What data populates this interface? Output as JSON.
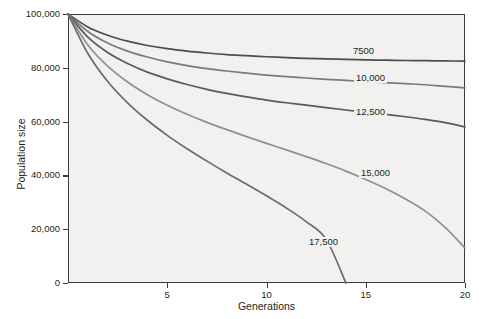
{
  "chart_data": {
    "type": "line",
    "title": "",
    "subtitle": "",
    "xlabel": "Generations",
    "ylabel": "Population size",
    "xlim": [
      0,
      20
    ],
    "ylim": [
      0,
      100000
    ],
    "xticks": [
      0,
      5,
      10,
      15,
      20
    ],
    "xtick_labels": [
      "",
      "5",
      "10",
      "15",
      "20"
    ],
    "yticks": [
      0,
      20000,
      40000,
      60000,
      80000,
      100000
    ],
    "ytick_labels": [
      "0",
      "20,000",
      "40,000",
      "60,000",
      "80,000",
      "100,000"
    ],
    "grid": false,
    "legend_position": "inline-annotations",
    "x": [
      0,
      1,
      2,
      3,
      4,
      5,
      6,
      7,
      8,
      9,
      10,
      11,
      12,
      13,
      14,
      15,
      16,
      17,
      18,
      19,
      20
    ],
    "series": [
      {
        "name": "7500",
        "label": "7500",
        "color": "#4d4d4d",
        "values": [
          100000,
          95200,
          92100,
          89900,
          88300,
          87100,
          86200,
          85500,
          84900,
          84500,
          84100,
          83800,
          83500,
          83300,
          83100,
          82950,
          82820,
          82720,
          82640,
          82560,
          82500
        ]
      },
      {
        "name": "10,000",
        "label": "10,000",
        "color": "#7a7a7a",
        "values": [
          100000,
          93500,
          89200,
          86200,
          84000,
          82200,
          80800,
          79700,
          78800,
          78000,
          77300,
          76700,
          76200,
          75700,
          75300,
          74900,
          74500,
          74100,
          73700,
          73100,
          72500
        ]
      },
      {
        "name": "12,500",
        "label": "12,500",
        "color": "#5a5a5a",
        "values": [
          100000,
          91400,
          85700,
          81600,
          78400,
          75900,
          73800,
          72000,
          70500,
          69200,
          68000,
          67000,
          66100,
          65200,
          64300,
          63500,
          62700,
          61800,
          60800,
          59600,
          58000
        ]
      },
      {
        "name": "15,000",
        "label": "15,000",
        "color": "#909090",
        "values": [
          100000,
          88500,
          80600,
          74700,
          70000,
          66100,
          62700,
          59700,
          57000,
          54400,
          51900,
          49500,
          47000,
          44400,
          41600,
          38500,
          35100,
          31200,
          26700,
          20700,
          13000
        ]
      },
      {
        "name": "17,500",
        "label": "17,500",
        "color": "#6b6b6b",
        "values": [
          100000,
          85300,
          74900,
          67000,
          60500,
          54900,
          49900,
          45300,
          40900,
          36700,
          32400,
          27900,
          22800,
          16300,
          0,
          0,
          0,
          0,
          0,
          0,
          0
        ]
      }
    ],
    "annotations": [
      {
        "text": "7500",
        "x_px": 370,
        "y_px": 51
      },
      {
        "text": "10,000",
        "x_px": 377,
        "y_px": 78
      },
      {
        "text": "12,500",
        "x_px": 377,
        "y_px": 112
      },
      {
        "text": "15,000",
        "x_px": 382,
        "y_px": 173
      },
      {
        "text": "17,500",
        "x_px": 330,
        "y_px": 242
      }
    ]
  },
  "axes": {
    "x_title": "Generations",
    "y_title": "Population size"
  }
}
